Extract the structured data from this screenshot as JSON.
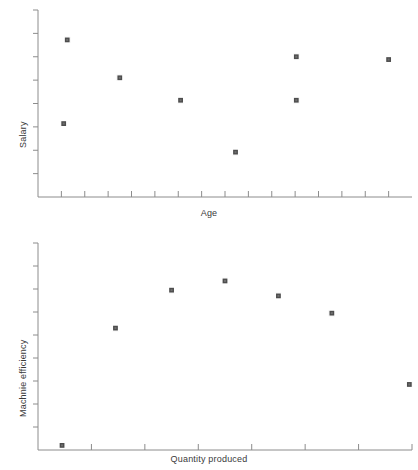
{
  "chart_data": [
    {
      "type": "scatter",
      "title": "",
      "xlabel": "Age",
      "ylabel": "Salary",
      "grid": false,
      "legend": null,
      "xlim": [
        0,
        16
      ],
      "ylim": [
        0,
        8
      ],
      "xticks": [
        1,
        2,
        3,
        4,
        5,
        6,
        7,
        8,
        9,
        10,
        11,
        12,
        13,
        14,
        15
      ],
      "yticks": [
        1,
        2,
        3,
        4,
        5,
        6,
        7
      ],
      "xtick_labels": [],
      "ytick_labels": [],
      "marker": "square",
      "marker_color": "#4d4d4d",
      "points": [
        {
          "x": 1.25,
          "y": 6.72
        },
        {
          "x": 1.1,
          "y": 3.14
        },
        {
          "x": 3.5,
          "y": 5.1
        },
        {
          "x": 6.1,
          "y": 4.14
        },
        {
          "x": 8.45,
          "y": 1.92
        },
        {
          "x": 11.05,
          "y": 6.0
        },
        {
          "x": 11.05,
          "y": 4.14
        },
        {
          "x": 15.0,
          "y": 5.88
        }
      ]
    },
    {
      "type": "scatter",
      "title": "",
      "xlabel": "Quantity produced",
      "ylabel": "Machnie efficiency",
      "grid": false,
      "legend": null,
      "xlim": [
        0,
        7
      ],
      "ylim": [
        0,
        9
      ],
      "xticks": [
        1,
        2,
        3,
        4,
        5,
        6,
        7
      ],
      "yticks": [
        1,
        2,
        3,
        4,
        5,
        6,
        7,
        8
      ],
      "xtick_labels": [],
      "ytick_labels": [],
      "marker": "square",
      "marker_color": "#4d4d4d",
      "points": [
        {
          "x": 0.45,
          "y": 0.2
        },
        {
          "x": 1.45,
          "y": 5.3
        },
        {
          "x": 2.5,
          "y": 6.95
        },
        {
          "x": 3.5,
          "y": 7.35
        },
        {
          "x": 4.5,
          "y": 6.7
        },
        {
          "x": 5.5,
          "y": 5.95
        },
        {
          "x": 6.95,
          "y": 2.85
        }
      ]
    }
  ],
  "panels": {
    "top": {
      "xlabel": "Age",
      "ylabel": "Salary"
    },
    "bottom": {
      "xlabel": "Quantity produced",
      "ylabel": "Machnie efficiency"
    }
  }
}
